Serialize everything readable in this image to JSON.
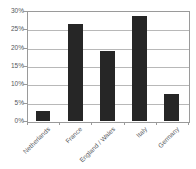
{
  "chart_data": {
    "type": "bar",
    "title": "",
    "subtitle": "",
    "xlabel": "",
    "ylabel": "",
    "categories": [
      "Netherlands",
      "France",
      "England / Wales",
      "Italy",
      "Germany"
    ],
    "values": [
      2.7,
      26.5,
      19.1,
      28.6,
      7.4
    ],
    "value_labels": [
      "2.7%",
      "26.5%",
      "19.1%",
      "28.6%",
      "7.4%"
    ],
    "ylim": [
      0,
      30
    ],
    "ytick_values": [
      0,
      5,
      10,
      15,
      20,
      25,
      30
    ],
    "ytick_labels": [
      "0%",
      "5%",
      "10%",
      "15%",
      "20%",
      "25%",
      "30%"
    ],
    "grid": true,
    "grid_axis": "y",
    "legend": false,
    "legend_position": "none",
    "bar_color": "#262626",
    "grid_color": "#b8b8b8",
    "axis_color": "#9a9a9a",
    "text_color": "#55585c",
    "background_color": "#ffffff",
    "xtick_label_rotation": -45,
    "series": [
      {
        "name": "",
        "values": [
          2.7,
          26.5,
          19.1,
          28.6,
          7.4
        ]
      }
    ]
  }
}
